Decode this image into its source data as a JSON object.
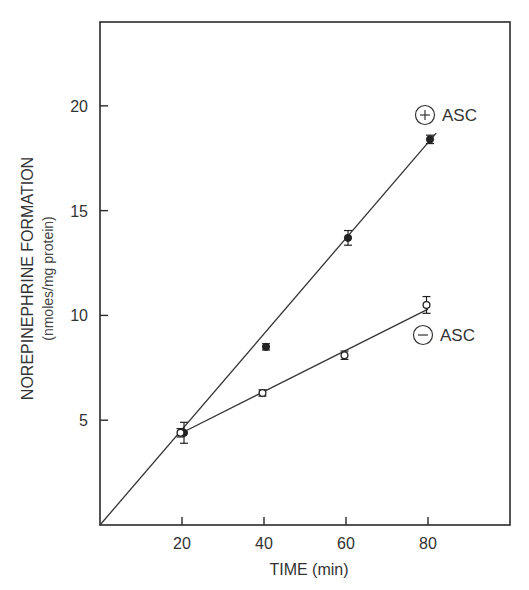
{
  "chart_data": {
    "type": "scatter",
    "title": "",
    "xlabel": "TIME (min)",
    "ylabel": "NOREPINEPHRINE FORMATION",
    "ylabel_units": "(nmoles/mg protein)",
    "xlim": [
      0,
      100
    ],
    "ylim": [
      0,
      24
    ],
    "xticks": [
      20,
      40,
      60,
      80
    ],
    "yticks": [
      5,
      10,
      15,
      20
    ],
    "xtick_labels": [
      "20",
      "40",
      "60",
      "80"
    ],
    "ytick_labels": [
      "5",
      "10",
      "15",
      "20"
    ],
    "grid": false,
    "series": [
      {
        "name": "+ ASC",
        "legend_symbol": "+",
        "legend_text": "ASC",
        "marker": "filled-circle",
        "x": [
          20,
          40,
          60,
          80
        ],
        "y": [
          4.4,
          8.5,
          13.7,
          18.4
        ],
        "yerr": [
          0.5,
          0.15,
          0.35,
          0.2
        ],
        "fit_line": {
          "x": [
            0,
            82
          ],
          "y": [
            0,
            18.7
          ]
        }
      },
      {
        "name": "- ASC",
        "legend_symbol": "−",
        "legend_text": "ASC",
        "marker": "open-circle",
        "x": [
          20,
          40,
          60,
          80
        ],
        "y": [
          4.4,
          6.3,
          8.1,
          10.5
        ],
        "yerr": [
          0.2,
          0.15,
          0.2,
          0.4
        ],
        "fit_line": {
          "x": [
            20,
            80
          ],
          "y": [
            4.4,
            10.3
          ]
        }
      }
    ],
    "annotations": [
      {
        "text": "ASC",
        "symbol": "+",
        "near_series": "+ ASC"
      },
      {
        "text": "ASC",
        "symbol": "−",
        "near_series": "- ASC"
      }
    ]
  }
}
